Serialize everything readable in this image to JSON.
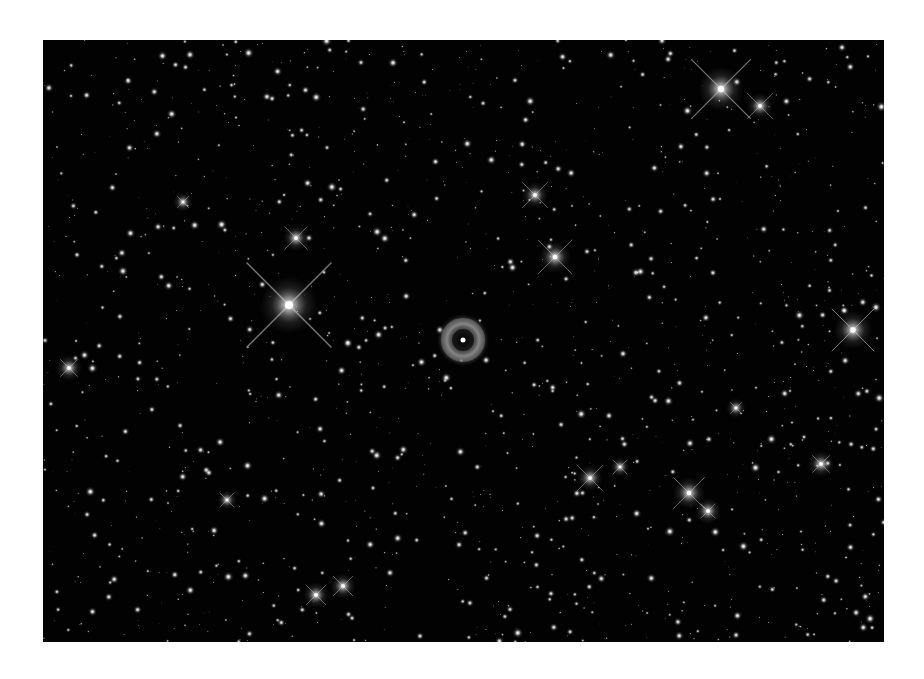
{
  "image": {
    "description": "Deep-sky star field with a small ring-shaped planetary nebula near the center",
    "background_color": "#020202",
    "frame": {
      "x": 43,
      "y": 40,
      "width": 841,
      "height": 602
    }
  },
  "nebula": {
    "cx": 420,
    "cy": 300,
    "r_outer": 20,
    "r_inner": 9,
    "ring_color": "#8a8a8a"
  },
  "bright_stars": [
    {
      "x": 246,
      "y": 265,
      "r": 9,
      "spikes": 60
    },
    {
      "x": 678,
      "y": 49,
      "r": 7,
      "spikes": 42
    },
    {
      "x": 717,
      "y": 66,
      "r": 4,
      "spikes": 18
    },
    {
      "x": 810,
      "y": 290,
      "r": 6,
      "spikes": 30
    },
    {
      "x": 512,
      "y": 217,
      "r": 5,
      "spikes": 24
    },
    {
      "x": 492,
      "y": 155,
      "r": 4,
      "spikes": 18
    },
    {
      "x": 253,
      "y": 198,
      "r": 4,
      "spikes": 16
    },
    {
      "x": 273,
      "y": 555,
      "r": 4,
      "spikes": 14
    },
    {
      "x": 300,
      "y": 546,
      "r": 4,
      "spikes": 14
    },
    {
      "x": 547,
      "y": 438,
      "r": 4,
      "spikes": 18
    },
    {
      "x": 646,
      "y": 453,
      "r": 5,
      "spikes": 22
    },
    {
      "x": 665,
      "y": 471,
      "r": 4,
      "spikes": 10
    },
    {
      "x": 577,
      "y": 427,
      "r": 3,
      "spikes": 10
    },
    {
      "x": 26,
      "y": 328,
      "r": 4,
      "spikes": 12
    },
    {
      "x": 778,
      "y": 424,
      "r": 4,
      "spikes": 12
    },
    {
      "x": 184,
      "y": 460,
      "r": 3,
      "spikes": 10
    },
    {
      "x": 140,
      "y": 162,
      "r": 3,
      "spikes": 8
    },
    {
      "x": 693,
      "y": 368,
      "r": 3,
      "spikes": 8
    }
  ],
  "field": {
    "seed": 1337,
    "count": 1400,
    "max_radius": 2.4
  }
}
